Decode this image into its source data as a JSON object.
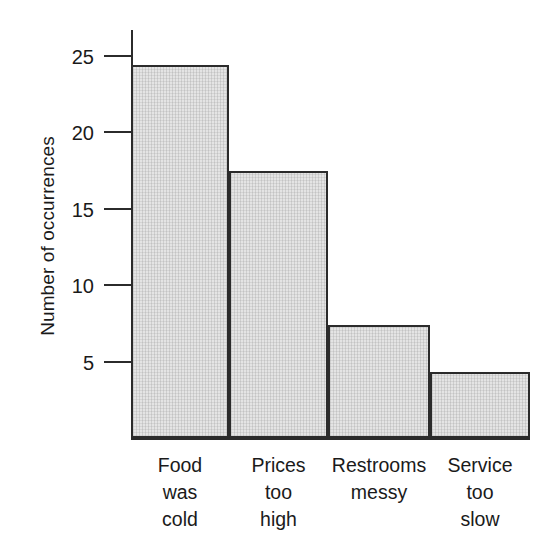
{
  "chart_data": {
    "type": "bar",
    "title": "",
    "xlabel": "",
    "ylabel": "Number of occurrences",
    "categories": [
      "Food\nwas\ncold",
      "Prices\ntoo\nhigh",
      "Restrooms\nmessy",
      "Service\ntoo\nslow"
    ],
    "values": [
      24.4,
      17.5,
      7.4,
      4.3
    ],
    "ylim": [
      0,
      26
    ],
    "yticks": [
      5,
      10,
      15,
      20,
      25
    ],
    "ytick_labels": [
      "5",
      "10",
      "15",
      "20",
      "25"
    ],
    "grid": false,
    "legend": false,
    "colors": {
      "bar_fill": "#e4e4e4",
      "bar_border": "#2b2b2b",
      "axis": "#2b2b2b",
      "text": "#1a1a1a",
      "background": "#ffffff"
    }
  }
}
